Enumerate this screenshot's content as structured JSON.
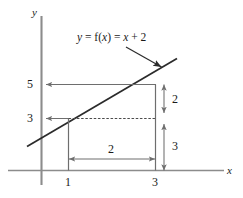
{
  "figure": {
    "type": "line-graph-diagram",
    "equation_label": {
      "full_text": "y = f(x) = x + 2",
      "part_y": "y",
      "part_eq1": " = ",
      "part_f": "f",
      "part_paren_open": "(",
      "part_x_arg": "x",
      "part_paren_close": ")",
      "part_eq2": " = ",
      "part_x": "x",
      "part_plus": " + 2"
    },
    "axes": {
      "x_label": "x",
      "y_label": "y",
      "axis_color": "#8c8c8c"
    },
    "y_ticks": [
      {
        "label": "5",
        "value": 5
      },
      {
        "label": "3",
        "value": 3
      }
    ],
    "x_ticks": [
      {
        "label": "1",
        "value": 1
      },
      {
        "label": "3",
        "value": 3
      }
    ],
    "measurements": [
      {
        "label": "2",
        "orientation": "horizontal",
        "description": "run from x=1 to x=3"
      },
      {
        "label": "2",
        "orientation": "vertical",
        "description": "rise from y=3 to y=5"
      },
      {
        "label": "3",
        "orientation": "vertical",
        "description": "height from y=0 to y=3"
      }
    ],
    "colors": {
      "line": "#2b2b2b",
      "guide": "#6e6e6e",
      "dotted": "#4a4a4a",
      "axis": "#8c8c8c",
      "text": "#1a1a1a"
    }
  }
}
